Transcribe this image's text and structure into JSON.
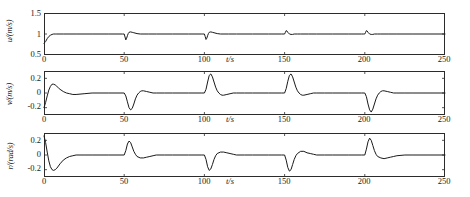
{
  "figure": {
    "type": "multi-panel-line-plot",
    "panel_count": 3,
    "background_color": "#ffffff",
    "line_color": "#1a1a1a",
    "axis_color": "#2b2b2b"
  },
  "chart_data": [
    {
      "type": "line",
      "panel_index": 0,
      "title": "",
      "xlabel": "t/s",
      "ylabel": "u/(m/s)",
      "xlim": [
        0,
        250
      ],
      "ylim": [
        0.5,
        1.5
      ],
      "xticks": [
        0,
        50,
        100,
        150,
        200,
        250
      ],
      "xticklabels": [
        "0",
        "50",
        "100",
        "150",
        "200",
        "250"
      ],
      "yticks": [
        0.5,
        1,
        1.5
      ],
      "yticklabels": [
        "0.5",
        "1",
        "1.5"
      ],
      "grid": false,
      "legend": null,
      "series": [
        {
          "name": "u",
          "x": [
            0,
            1,
            2,
            3,
            4,
            5,
            6,
            7,
            8,
            10,
            12,
            15,
            20,
            30,
            40,
            48,
            49,
            50,
            50.5,
            51,
            51.5,
            52,
            52.5,
            53,
            54,
            55,
            56,
            58,
            60,
            65,
            70,
            80,
            90,
            98,
            99,
            100,
            100.5,
            101,
            101.5,
            102,
            102.5,
            103,
            104,
            105,
            106,
            108,
            110,
            115,
            120,
            130,
            140,
            148,
            149,
            150,
            150.5,
            151,
            151.5,
            152,
            152.5,
            153,
            154,
            155,
            156,
            158,
            160,
            165,
            170,
            180,
            190,
            198,
            199,
            200,
            200.5,
            201,
            201.5,
            202,
            202.5,
            203,
            204,
            205,
            206,
            208,
            210,
            215,
            220,
            230,
            240,
            250
          ],
          "y": [
            0.78,
            0.82,
            0.89,
            0.94,
            0.97,
            0.99,
            1.0,
            1.0,
            1.0,
            1.0,
            1.0,
            1.0,
            1.0,
            1.0,
            1.0,
            1.0,
            1.0,
            1.0,
            0.93,
            0.86,
            0.9,
            0.96,
            1.01,
            1.04,
            1.05,
            1.04,
            1.03,
            1.01,
            1.0,
            1.0,
            1.0,
            1.0,
            1.0,
            1.0,
            1.0,
            1.0,
            0.94,
            0.87,
            0.9,
            0.96,
            1.01,
            1.04,
            1.05,
            1.04,
            1.03,
            1.01,
            1.0,
            1.0,
            1.0,
            1.0,
            1.0,
            1.0,
            1.0,
            1.0,
            1.04,
            1.08,
            1.07,
            1.04,
            1.02,
            1.0,
            0.99,
            0.99,
            1.0,
            1.0,
            1.0,
            1.0,
            1.0,
            1.0,
            1.0,
            1.0,
            1.0,
            1.0,
            1.04,
            1.08,
            1.07,
            1.04,
            1.02,
            1.0,
            0.99,
            0.99,
            1.0,
            1.0,
            1.0,
            1.0,
            1.0,
            1.0,
            1.0,
            1.0
          ]
        }
      ]
    },
    {
      "type": "line",
      "panel_index": 1,
      "title": "",
      "xlabel": "t/s",
      "ylabel": "v/(m/s)",
      "xlim": [
        0,
        250
      ],
      "ylim": [
        -0.3,
        0.3
      ],
      "xticks": [
        0,
        50,
        100,
        150,
        200,
        250
      ],
      "xticklabels": [
        "0",
        "50",
        "100",
        "150",
        "200",
        "250"
      ],
      "yticks": [
        -0.2,
        0,
        0.2
      ],
      "yticklabels": [
        "-0.2",
        "0",
        "0.2"
      ],
      "grid": false,
      "legend": null,
      "series": [
        {
          "name": "v",
          "x": [
            0,
            1,
            2,
            3,
            4,
            5,
            6,
            7,
            8,
            9,
            10,
            12,
            14,
            16,
            18,
            20,
            25,
            30,
            40,
            48,
            50,
            51,
            52,
            53,
            54,
            55,
            56,
            57,
            58,
            59,
            60,
            61,
            62,
            64,
            66,
            68,
            70,
            75,
            80,
            90,
            98,
            100,
            101,
            102,
            103,
            104,
            105,
            106,
            107,
            108,
            109,
            110,
            111,
            112,
            114,
            116,
            118,
            120,
            125,
            130,
            140,
            148,
            150,
            151,
            152,
            153,
            154,
            155,
            156,
            157,
            158,
            159,
            160,
            161,
            162,
            164,
            166,
            168,
            170,
            175,
            180,
            190,
            198,
            200,
            201,
            202,
            203,
            204,
            205,
            206,
            207,
            208,
            209,
            210,
            211,
            212,
            214,
            216,
            218,
            220,
            225,
            230,
            240,
            250
          ],
          "y": [
            -0.2,
            -0.13,
            -0.04,
            0.04,
            0.09,
            0.12,
            0.12,
            0.11,
            0.09,
            0.07,
            0.05,
            0.02,
            0.0,
            -0.01,
            -0.02,
            -0.02,
            -0.01,
            0.0,
            0.0,
            0.0,
            0.0,
            -0.04,
            -0.12,
            -0.2,
            -0.23,
            -0.21,
            -0.15,
            -0.08,
            -0.03,
            0.0,
            0.02,
            0.03,
            0.03,
            0.02,
            0.01,
            0.0,
            0.0,
            0.0,
            0.0,
            0.0,
            0.0,
            0.0,
            0.05,
            0.15,
            0.24,
            0.26,
            0.22,
            0.15,
            0.08,
            0.03,
            0.0,
            -0.02,
            -0.03,
            -0.03,
            -0.02,
            -0.01,
            0.0,
            0.0,
            0.0,
            0.0,
            0.0,
            0.0,
            0.0,
            0.06,
            0.16,
            0.24,
            0.26,
            0.22,
            0.15,
            0.08,
            0.03,
            0.0,
            -0.02,
            -0.03,
            -0.03,
            -0.02,
            -0.01,
            0.0,
            0.0,
            0.0,
            0.0,
            0.0,
            0.0,
            0.0,
            -0.05,
            -0.15,
            -0.23,
            -0.26,
            -0.22,
            -0.15,
            -0.08,
            -0.03,
            0.0,
            0.02,
            0.03,
            0.03,
            0.02,
            0.01,
            0.0,
            0.0,
            0.0,
            0.0,
            0.0,
            0.0
          ]
        }
      ]
    },
    {
      "type": "line",
      "panel_index": 2,
      "title": "",
      "xlabel": "t/s",
      "ylabel": "r/(rad/s)",
      "xlim": [
        0,
        250
      ],
      "ylim": [
        -0.3,
        0.3
      ],
      "xticks": [
        0,
        50,
        100,
        150,
        200,
        250
      ],
      "xticklabels": [
        "0",
        "50",
        "100",
        "150",
        "200",
        "250"
      ],
      "yticks": [
        -0.2,
        0,
        0.2
      ],
      "yticklabels": [
        "-0.2",
        "0",
        "0.2"
      ],
      "grid": false,
      "legend": null,
      "series": [
        {
          "name": "r",
          "x": [
            0,
            1,
            2,
            3,
            4,
            5,
            6,
            7,
            8,
            9,
            10,
            12,
            14,
            16,
            18,
            20,
            25,
            30,
            40,
            48,
            50,
            51,
            52,
            53,
            54,
            55,
            56,
            57,
            58,
            60,
            62,
            64,
            66,
            68,
            70,
            75,
            80,
            90,
            98,
            100,
            101,
            102,
            103,
            104,
            105,
            106,
            107,
            108,
            110,
            112,
            114,
            116,
            118,
            120,
            125,
            130,
            140,
            148,
            150,
            151,
            152,
            153,
            154,
            155,
            156,
            157,
            158,
            160,
            162,
            164,
            166,
            168,
            170,
            175,
            180,
            190,
            198,
            200,
            201,
            202,
            203,
            204,
            205,
            206,
            207,
            208,
            210,
            212,
            214,
            216,
            218,
            220,
            225,
            230,
            240,
            250
          ],
          "y": [
            0.26,
            0.17,
            0.04,
            -0.08,
            -0.16,
            -0.2,
            -0.21,
            -0.2,
            -0.18,
            -0.15,
            -0.12,
            -0.07,
            -0.04,
            -0.02,
            -0.01,
            0.0,
            0.0,
            0.0,
            0.0,
            0.0,
            0.0,
            0.06,
            0.15,
            0.19,
            0.17,
            0.11,
            0.05,
            0.01,
            -0.02,
            -0.04,
            -0.04,
            -0.03,
            -0.02,
            -0.01,
            0.0,
            0.0,
            0.0,
            0.0,
            0.0,
            0.0,
            -0.06,
            -0.16,
            -0.21,
            -0.19,
            -0.13,
            -0.06,
            -0.01,
            0.02,
            0.04,
            0.04,
            0.03,
            0.02,
            0.01,
            0.0,
            0.0,
            0.0,
            0.0,
            0.0,
            0.0,
            -0.07,
            -0.17,
            -0.22,
            -0.2,
            -0.13,
            -0.06,
            -0.01,
            0.02,
            0.05,
            0.05,
            0.03,
            0.02,
            0.01,
            0.0,
            0.0,
            0.0,
            0.0,
            0.0,
            0.0,
            0.08,
            0.18,
            0.23,
            0.2,
            0.13,
            0.06,
            0.01,
            -0.02,
            -0.04,
            -0.05,
            -0.04,
            -0.03,
            -0.02,
            -0.01,
            0.0,
            0.0,
            0.0,
            0.0,
            0.0
          ]
        }
      ]
    }
  ]
}
